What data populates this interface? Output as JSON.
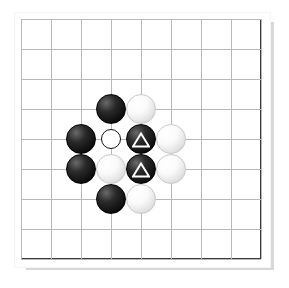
{
  "diagram": {
    "kind": "go-board-diagram",
    "title": "",
    "board": {
      "size_label": "9x9",
      "columns": 9,
      "rows": 9,
      "grid_spacing_px": 30,
      "grid_color": "#b9b9b9",
      "border_color": "#3a3a3a",
      "paper_color": "#ffffff",
      "shadow_color": "#d8d8d8"
    },
    "colors": {
      "black_stone": "#101010",
      "white_stone": "#f2f2f2",
      "marker_stroke": "#ffffff",
      "circle_marker_stroke": "#111111"
    },
    "legend": {
      "triangle_marker_name": "triangle-marker",
      "circle_marker_name": "circle-marker"
    },
    "stones": [
      {
        "col": 4,
        "row": 4,
        "color": "black",
        "marker": "none",
        "name": "stone-black-d4"
      },
      {
        "col": 5,
        "row": 4,
        "color": "white",
        "marker": "none",
        "name": "stone-white-e4"
      },
      {
        "col": 3,
        "row": 5,
        "color": "black",
        "marker": "none",
        "name": "stone-black-c5"
      },
      {
        "col": 5,
        "row": 5,
        "color": "black",
        "marker": "triangle",
        "name": "stone-black-e5-triangle"
      },
      {
        "col": 6,
        "row": 5,
        "color": "white",
        "marker": "none",
        "name": "stone-white-f5"
      },
      {
        "col": 3,
        "row": 6,
        "color": "black",
        "marker": "none",
        "name": "stone-black-c6"
      },
      {
        "col": 4,
        "row": 6,
        "color": "white",
        "marker": "none",
        "name": "stone-white-d6"
      },
      {
        "col": 5,
        "row": 6,
        "color": "black",
        "marker": "triangle",
        "name": "stone-black-e6-triangle"
      },
      {
        "col": 6,
        "row": 6,
        "color": "white",
        "marker": "none",
        "name": "stone-white-f6"
      },
      {
        "col": 4,
        "row": 7,
        "color": "black",
        "marker": "none",
        "name": "stone-black-d7"
      },
      {
        "col": 5,
        "row": 7,
        "color": "white",
        "marker": "none",
        "name": "stone-white-e7"
      }
    ],
    "markers": [
      {
        "col": 4,
        "row": 5,
        "type": "circle",
        "name": "circle-marker-d5",
        "note": "empty intersection marked with an open circle"
      }
    ]
  }
}
